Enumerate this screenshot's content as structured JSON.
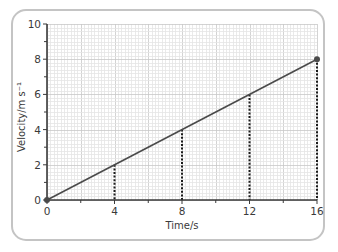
{
  "chart_data": {
    "type": "line",
    "title": "",
    "xlabel": "Time/s",
    "ylabel": "Velocity/m s⁻¹",
    "xlim": [
      0,
      16
    ],
    "ylim": [
      0,
      10
    ],
    "x_ticks": [
      0,
      4,
      8,
      12,
      16
    ],
    "x_minor_ticks": [
      2,
      6,
      10,
      14
    ],
    "y_ticks": [
      0,
      2,
      4,
      6,
      8,
      10
    ],
    "y_minor_ticks": [
      1,
      3,
      5,
      7,
      9
    ],
    "grid": true,
    "series": [
      {
        "name": "velocity",
        "x": [
          0,
          16
        ],
        "y": [
          0,
          8
        ],
        "color": "#4a4a4a",
        "endpoint_markers": true
      }
    ],
    "dashed_drop_lines": [
      {
        "x": 4,
        "y": 2
      },
      {
        "x": 8,
        "y": 4
      },
      {
        "x": 12,
        "y": 6
      },
      {
        "x": 16,
        "y": 8
      }
    ],
    "colors": {
      "line": "#4a4a4a",
      "axis": "#3a3a3a",
      "grid_minor": "#e4e4e4",
      "grid_major": "#c8c8c8",
      "frame": "#c4c4c4",
      "dashed": "#1a1a1a"
    }
  }
}
